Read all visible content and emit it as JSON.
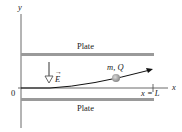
{
  "diagram": {
    "axes": {
      "y_label": "y",
      "x_label": "x",
      "origin_label": "0"
    },
    "top_plate": {
      "label": "Plate"
    },
    "bottom_plate": {
      "label": "Plate"
    },
    "field": {
      "label": "E",
      "direction": "down"
    },
    "particle": {
      "label": "m, Q"
    },
    "end_marker": {
      "label": "x = L"
    },
    "colors": {
      "plate": "#8a8a8a",
      "line": "#222222",
      "particle": "#9a9a9a"
    }
  }
}
